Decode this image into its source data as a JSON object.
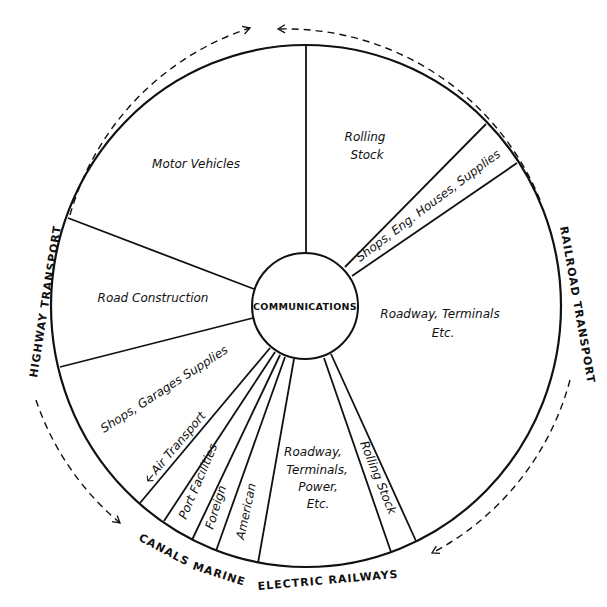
{
  "diagram": {
    "center_label": "COMMUNICATIONS",
    "outer_labels": {
      "highway": "HIGHWAY TRANSPORT",
      "railroad": "RAILROAD TRANSPORT",
      "canals": "CANALS",
      "marine": "MARINE",
      "electric": "ELECTRIC RAILWAYS"
    },
    "segments": {
      "motor_vehicles": "Motor Vehicles",
      "rolling_stock_rr_line1": "Rolling",
      "rolling_stock_rr_line2": "Stock",
      "shops_eng": "Shops, Eng. Houses, Supplies",
      "roadway_rr_line1": "Roadway, Terminals",
      "roadway_rr_line2": "Etc.",
      "road_construction": "Road Construction",
      "shops_garages": "Shops, Garages Supplies",
      "air_transport": "Air Transport",
      "port_facilities": "Port Facilities",
      "foreign": "Foreign",
      "american": "American",
      "roadway_er_line1": "Roadway,",
      "roadway_er_line2": "Terminals,",
      "roadway_er_line3": "Power,",
      "roadway_er_line4": "Etc.",
      "rolling_stock_er": "Rolling Stock"
    },
    "colors": {
      "ink": "#111111",
      "paper": "#ffffff"
    }
  }
}
